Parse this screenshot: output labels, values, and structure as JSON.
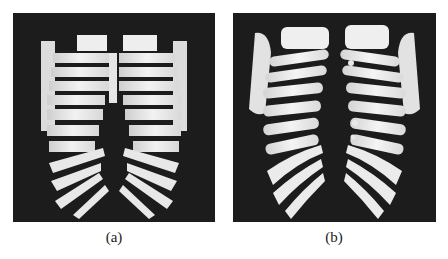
{
  "figure": {
    "subfigures": [
      {
        "id": "a",
        "caption": "(a)",
        "content": "voxel-rendered rib cage (blocky)",
        "background": "#1c1c1c",
        "bone_color": "#e8e8e8"
      },
      {
        "id": "b",
        "caption": "(b)",
        "content": "smoothed surface-rendered rib cage",
        "background": "#1c1c1c",
        "bone_color": "#ececec"
      }
    ]
  }
}
